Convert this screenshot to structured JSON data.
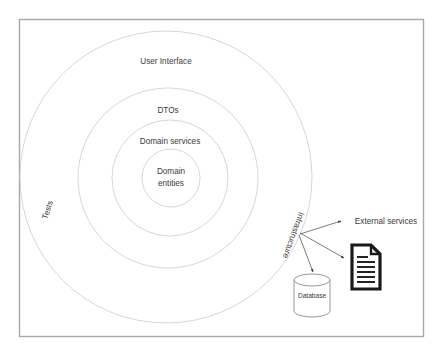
{
  "canvas": {
    "width": 440,
    "height": 353,
    "background": "#ffffff",
    "frame_color": "#a8a8a8"
  },
  "diagram": {
    "type": "onion-architecture",
    "ring_stroke_color": "#d3d3d3",
    "text_color": "#3b3b3b",
    "rings": [
      {
        "name": "user-interface",
        "label": "User Interface",
        "cx": 166,
        "cy": 177,
        "r": 146
      },
      {
        "name": "dtos",
        "label": "DTOs",
        "cx": 168,
        "cy": 178,
        "r": 90
      },
      {
        "name": "domain-services",
        "label": "Domain services",
        "cx": 170,
        "cy": 178,
        "r": 58
      },
      {
        "name": "domain-entities",
        "label": "Domain entities",
        "line1": "Domain",
        "line2": "entities",
        "cx": 171,
        "cy": 178,
        "r": 29
      }
    ],
    "rotated_labels": [
      {
        "name": "tests",
        "label": "Tests",
        "x": 48,
        "y": 210,
        "rotation": -72
      },
      {
        "name": "infrastructure",
        "label": "Infrastructure",
        "x": 293,
        "y": 235,
        "rotation": -250
      }
    ],
    "nodes": [
      {
        "name": "external-services",
        "label": "External services",
        "x": 385,
        "y": 222,
        "shape": "text"
      },
      {
        "name": "document",
        "label": "",
        "x": 366,
        "y": 267,
        "shape": "document",
        "line_count": 6
      },
      {
        "name": "database",
        "label": "Database",
        "x": 312,
        "y": 295,
        "shape": "cylinder"
      }
    ],
    "connectors": [
      {
        "name": "infrastructure-to-external-services",
        "from": "infrastructure-hub",
        "to": "external-services"
      },
      {
        "name": "infrastructure-to-document",
        "from": "infrastructure-hub",
        "to": "document"
      },
      {
        "name": "infrastructure-to-database",
        "from": "infrastructure-hub",
        "to": "database"
      }
    ],
    "hub": {
      "name": "infrastructure-hub",
      "x": 297,
      "y": 232
    }
  }
}
